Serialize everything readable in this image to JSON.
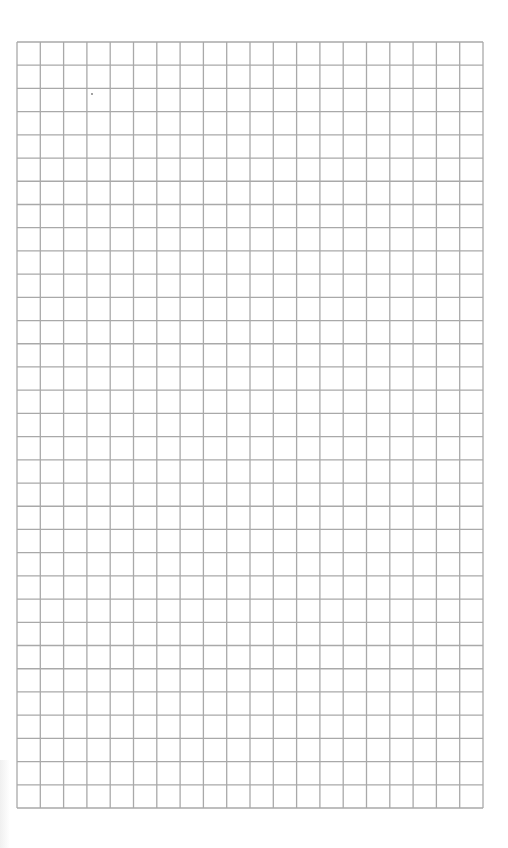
{
  "sheet": {
    "type": "graph-paper",
    "columns": 20,
    "rows": 33,
    "grid_left": 17,
    "grid_top": 42,
    "grid_right": 483,
    "grid_bottom": 808,
    "line_color": "#a9a9a9",
    "line_width": 1.3,
    "background": "#ffffff",
    "marks": [
      {
        "x": 92,
        "y": 94,
        "r": 0.9,
        "color": "#777777"
      }
    ]
  }
}
